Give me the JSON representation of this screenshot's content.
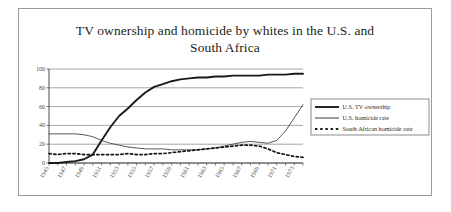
{
  "figure": {
    "title_line_1": "TV ownership and homicide by whites in the U.S. and",
    "title_line_2": "South Africa"
  },
  "chart_data": {
    "type": "line",
    "title": "TV ownership and homicide by whites in the U.S. and South Africa",
    "xlabel": "",
    "ylabel": "",
    "xlim": [
      1945,
      1974
    ],
    "ylim": [
      0,
      100
    ],
    "ytick_values": [
      0,
      20,
      40,
      60,
      80,
      100
    ],
    "ytick_labels": [
      "0",
      "20",
      "40",
      "60",
      "80",
      "100"
    ],
    "grid": "horizontal",
    "legend_position": "right",
    "x": [
      1945,
      1946,
      1947,
      1948,
      1949,
      1950,
      1951,
      1952,
      1953,
      1954,
      1955,
      1956,
      1957,
      1958,
      1959,
      1960,
      1961,
      1962,
      1963,
      1964,
      1965,
      1966,
      1967,
      1968,
      1969,
      1970,
      1971,
      1972,
      1973,
      1974
    ],
    "xtick_labels": [
      "1945",
      "1947",
      "1949",
      "1951",
      "1953",
      "1955",
      "1957",
      "1959",
      "1961",
      "1963",
      "1965",
      "1967",
      "1969",
      "1971",
      "1973"
    ],
    "xtick_values": [
      1945,
      1947,
      1949,
      1951,
      1953,
      1955,
      1957,
      1959,
      1961,
      1963,
      1965,
      1967,
      1969,
      1971,
      1973
    ],
    "series": [
      {
        "name": "U.S. TV ownership",
        "style": "thick-solid",
        "color": "#1a1a1a",
        "values": [
          0,
          0,
          1,
          2,
          4,
          9,
          24,
          38,
          50,
          58,
          67,
          75,
          81,
          84,
          87,
          89,
          90,
          91,
          91,
          92,
          92,
          93,
          93,
          93,
          93,
          94,
          94,
          94,
          95,
          95
        ]
      },
      {
        "name": "U.S. homicide rate",
        "style": "thin-solid",
        "color": "#3a3a3a",
        "values": [
          31,
          31,
          31,
          31,
          30,
          28,
          24,
          21,
          19,
          17,
          16,
          15,
          15,
          15,
          14,
          14,
          14,
          14,
          15,
          16,
          18,
          20,
          22,
          23,
          22,
          21,
          24,
          34,
          48,
          62
        ]
      },
      {
        "name": "South African homicide rate",
        "style": "dotted",
        "color": "#141414",
        "values": [
          10,
          9,
          10,
          10,
          9,
          9,
          9,
          9,
          9,
          10,
          9,
          9,
          10,
          10,
          11,
          12,
          13,
          14,
          15,
          16,
          17,
          18,
          19,
          19,
          18,
          15,
          11,
          9,
          7,
          6
        ]
      }
    ]
  },
  "legend": {
    "items": [
      {
        "label": "U.S. TV ownership",
        "style": "thick-solid"
      },
      {
        "label": "U.S. homicide rate",
        "style": "thin-solid"
      },
      {
        "label": "South African homicide rate",
        "style": "dotted"
      }
    ]
  }
}
